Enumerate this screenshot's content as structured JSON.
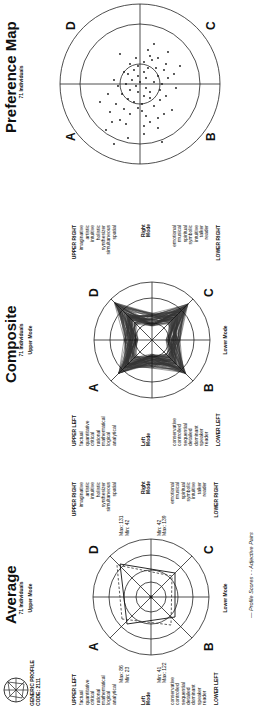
{
  "logo": {
    "line1": "GENERIC PROFILE",
    "line2": "CODE: 2111"
  },
  "footer": {
    "legend": "—  Profile Scores  - -  Adjective Pairs"
  },
  "panels": {
    "average": {
      "title": "Average",
      "count": "71 Individuals",
      "upper_mode": "Upper Mode",
      "lower_mode": "Lower Mode",
      "left_mode": [
        "Left",
        "Mode"
      ],
      "right_mode": [
        "Right",
        "Mode"
      ],
      "quadrants": {
        "A": "A",
        "B": "B",
        "C": "C",
        "D": "D"
      },
      "upper_left": {
        "heading": "UPPER LEFT",
        "words": [
          "factual",
          "quantitative",
          "critical",
          "rational",
          "mathematical",
          "logical",
          "analytical"
        ],
        "max": "Max: 86",
        "min": "Min: 23"
      },
      "lower_left": {
        "heading": "LOWER LEFT",
        "words": [
          "conservative",
          "controlled",
          "sequential",
          "detailed",
          "dominant",
          "speaker",
          "reader"
        ],
        "min": "Min: 41",
        "max": "Max: 122"
      },
      "upper_right": {
        "heading": "UPPER RIGHT",
        "words": [
          "imaginative",
          "artistic",
          "intuitive",
          "holistic",
          "synthesizer",
          "simultaneous",
          "spatial"
        ],
        "max": "Max: 131",
        "min": "Min: 42"
      },
      "lower_right": {
        "heading": "LOWER RIGHT",
        "words": [
          "emotional",
          "musical",
          "spiritual",
          "symbolic",
          "intuitive",
          "talker",
          "reader"
        ],
        "min": "Min: 42",
        "max": "Max: 139"
      }
    },
    "composite": {
      "title": "Composite",
      "count": "71 Individuals",
      "upper_mode": "Upper Mode",
      "lower_mode": "Lower Mode",
      "left_mode": [
        "Left",
        "Mode"
      ],
      "right_mode": [
        "Right",
        "Mode"
      ],
      "quadrants": {
        "A": "A",
        "B": "B",
        "C": "C",
        "D": "D"
      },
      "upper_left": {
        "heading": "UPPER LEFT",
        "words": [
          "factual",
          "quantitative",
          "critical",
          "rational",
          "mathematical",
          "logical",
          "analytical"
        ]
      },
      "lower_left": {
        "heading": "LOWER LEFT",
        "words": [
          "conservative",
          "controlled",
          "sequential",
          "detailed",
          "dominant",
          "speaker",
          "reader"
        ]
      },
      "upper_right": {
        "heading": "UPPER RIGHT",
        "words": [
          "imaginative",
          "artistic",
          "intuitive",
          "holistic",
          "synthesizer",
          "simultaneous",
          "spatial"
        ]
      },
      "lower_right": {
        "heading": "LOWER RIGHT",
        "words": [
          "emotional",
          "musical",
          "spiritual",
          "symbolic",
          "intuitive",
          "talker",
          "reader"
        ]
      }
    },
    "preference_map": {
      "title": "Preference Map",
      "count": "71 Individuals",
      "quadrants": {
        "A": "A",
        "B": "B",
        "C": "C",
        "D": "D"
      }
    }
  }
}
